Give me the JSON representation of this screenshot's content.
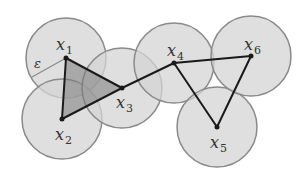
{
  "diagram": {
    "colors": {
      "background": "#ffffff",
      "ball_fill": "#d4d4d4",
      "ball_fill_opacity": 0.75,
      "ball_stroke": "#8a8a8a",
      "edge": "#1a1a1a",
      "triangle_fill": "#7a7a7a",
      "triangle_fill_opacity": 0.55,
      "point": "#1a1a1a",
      "label": "#333333"
    },
    "radius": 40,
    "points": [
      {
        "id": "x1",
        "label": "x",
        "sub": "1",
        "cx": 66,
        "cy": 58,
        "lx": 56,
        "ly": 50
      },
      {
        "id": "x2",
        "label": "x",
        "sub": "2",
        "cx": 62,
        "cy": 119,
        "lx": 55,
        "ly": 140
      },
      {
        "id": "x3",
        "label": "x",
        "sub": "3",
        "cx": 122,
        "cy": 88,
        "lx": 116,
        "ly": 108
      },
      {
        "id": "x4",
        "label": "x",
        "sub": "4",
        "cx": 174,
        "cy": 63,
        "lx": 167,
        "ly": 56
      },
      {
        "id": "x5",
        "label": "x",
        "sub": "5",
        "cx": 217,
        "cy": 127,
        "lx": 210,
        "ly": 148
      },
      {
        "id": "x6",
        "label": "x",
        "sub": "6",
        "cx": 251,
        "cy": 56,
        "lx": 244,
        "ly": 50
      }
    ],
    "edges": [
      [
        "x1",
        "x2"
      ],
      [
        "x1",
        "x3"
      ],
      [
        "x2",
        "x3"
      ],
      [
        "x3",
        "x4"
      ],
      [
        "x4",
        "x6"
      ],
      [
        "x4",
        "x5"
      ],
      [
        "x5",
        "x6"
      ]
    ],
    "triangles": [
      [
        "x1",
        "x2",
        "x3"
      ]
    ],
    "epsilon": {
      "label": "ε",
      "from": "x1",
      "to_x": 32,
      "to_y": 77,
      "lx": 34,
      "ly": 68
    }
  }
}
